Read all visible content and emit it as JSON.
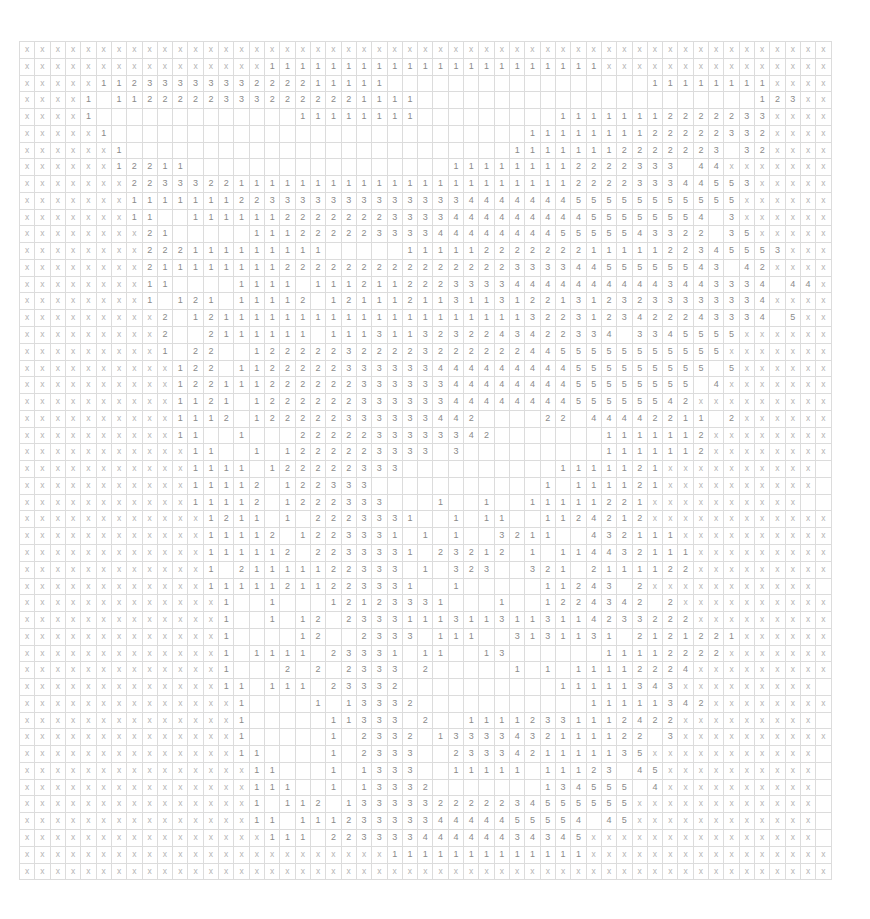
{
  "board": {
    "cols": 53,
    "rows": 50,
    "legend": {
      "x": "unrevealed/marked",
      ".": "empty",
      "1-5": "adjacent count"
    },
    "colors": {
      "number": "#8a8a8a",
      "x_mark": "#b4b4b4",
      "gridline": "#dcdcdc",
      "background": "#ffffff"
    },
    "grid": [
      "xxxxxxxxxxxxxxxxxxxxxxxxxxxxxxxxxxxxxxxxxxxxxxxxxxxxx",
      "xxxxxxxxxxxxxxxx1111111111111111111111xxxxxxxxxxxxxxx",
      "xxxxx1123333333222211111.................11111111xxxxx",
      "xxxx1.11222223332222221111......................123xx",
      "xxxx1.............11111111.........11111112222233xxxx",
      "xxxxx1...........................1111111122222332xxxx",
      "xxxxxx1.........................11111112222223 32xxxx",
      "xxxxxx12211.................111111112222333 44xxxxxxx",
      "xxxxxxx22333221111111111111111111111222233344553xxxxx",
      "xxxxxxx1111111223333333333333444444455555555555xxxxxx",
      "xxxxxxx11..1111112222222333344444444455555554 3xxxxxx",
      "xxxxxxxx21.....111222223333444444445555543322 35xxxxx",
      "xxxxxxxx222111111111.....1111122222221111122345553xxx",
      "xxxxxxxx21111111122222222222222233334455555543 42xxxx",
      "xxxxxxxx11....1111.111211222333344444444443443334 44x",
      "xxxxxxxx1.121.11112.12111211311312213123233333334xxxx",
      "xxxxxxxxx2.12111111111111111111113223123422243334 5xx",
      "xxxxxxxxx2..2111111.1113113232243422334 3345555xxxxxx",
      "xxxxxxxxx1.22..1222223222232222224455555555555xxxxxxx",
      "xxxxxxxxxx122.1122222333333444444444555555555 5xxxxxx",
      "xxxxxxxxxx1221112222223333334444444455555555 4xxxxxxx",
      "xxxxxxxxxx1121.12222223333334444444455555542xxxxxxxxx",
      "xxxxxxxxxx1112.122222333333442....22 44442211 2xxxxxx",
      "xxxxxxxxxx11..1...2222233333342.......1111112xxxxxxxx",
      "xxxxxxxxxxx11..1.1222223333 3 ........1111112xxxxxxxx",
      "xxxxxxxxxxx1111.122222333..........1111121xxxxxxxxxx",
      "xxxxxxxxxxx11112.122333...........1.111121xxxxxxxxxx",
      "xxxxxxxxxxx11112.1222333...1..1..11111221xxxxxxxxxx",
      "xxxxxxxxxxxx1211 1.2223331..1.11..1124212xxxxxxxxxxxx",
      "xxxxxxxxxxxx11112.1223331.1.1..3211..432111xxxxxxxxxx",
      "xxxxxxxxxxxx111112.2233331.23212 1.114432111xxxxxxxxx",
      "xxxxxxxxxxxx1.21111122333 1.323..321.2111122xxxxxxxxx",
      "xxxxxxxxxxxx11111211223331..1.....11243 2xxxxxxxxxxx",
      "xxxxxxxxxxxxx1..1...12123331...1..1224342 2xxxxxxxxxx",
      "xxxxxxxxxxxxx1..1.12.23331113113113114233222xxxxxxxxx",
      "xxxxxxxxxxxxx1....12..2333 111..3131131 2121221xxxxxx",
      "xxxxxxxxxxxxx1.1111.23331.11..13......11112222xxxxxxx",
      "xxxxxxxxxxxxx1...2.2.2333 2.....1.1.11112224xxxxxxxxx",
      "xxxxxxxxxxxxx11.111.23332..........11111343xxxxxxxxx",
      "xxxxxxxxxxxxxx1....1.13332...........11111342xxxxxxxx",
      "xxxxxxxxxxxxxx1.....11333 2..11112331112422xxxxxxxxx",
      "xxxxxxxxxxxxxx1.....1.2332.13333432111122 3xxxxxxxxxx",
      "xxxxxxxxxxxxxx11....1.2333..2333421111135xxxxxxxxxxx",
      "xxxxxxxxxxxxxxx11...1.1333..11111.11123 45xxxxxxxxxx",
      "xxxxxxxxxxxxxxx111..1.13332.......134555 4xxxxxxxxxx",
      "xxxxxxxxxxxxxxx1.112.1333332222234555555xxxxxxxxxxxx",
      "xxxxxxxxxxxxxxx11.1112333334444455554 45xxxxxxxxxxxx",
      "xxxxxxxxxxxxxxxx111.22333344444434345xxxxxxxxxxxxxxx",
      "xxxxxxxxxxxxxxxxxxxxxxxx1111111111111xxxxxxxxxxxxxxxx",
      "xxxxxxxxxxxxxxxxxxxxxxxxxxxxxxxxxxxxxxxxxxxxxxxxxxxxx"
    ]
  }
}
